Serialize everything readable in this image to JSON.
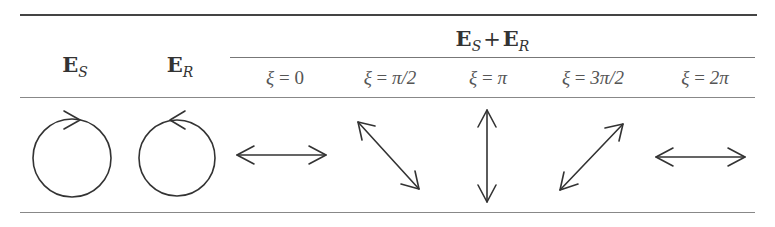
{
  "table": {
    "columns": {
      "es": {
        "main": "E",
        "sub": "S"
      },
      "er": {
        "main": "E",
        "sub": "R"
      },
      "sum": {
        "main1": "E",
        "sub1": "S",
        "plus": "+",
        "main2": "E",
        "sub2": "R"
      }
    },
    "phase_headers": [
      {
        "var": "ξ",
        "eq": " = ",
        "val": "0"
      },
      {
        "var": "ξ",
        "eq": " = ",
        "val": "π/2"
      },
      {
        "var": "ξ",
        "eq": " = ",
        "val": "π"
      },
      {
        "var": "ξ",
        "eq": " = ",
        "val": "3π/2"
      },
      {
        "var": "ξ",
        "eq": " = ",
        "val": "2π"
      }
    ],
    "row": {
      "es": "circle-clockwise-icon",
      "er": "circle-counterclockwise-icon",
      "polarizations": [
        "horizontal-double-arrow-icon",
        "diagonal-down-double-arrow-icon",
        "vertical-double-arrow-icon",
        "diagonal-up-double-arrow-icon",
        "horizontal-double-arrow-icon"
      ]
    }
  }
}
